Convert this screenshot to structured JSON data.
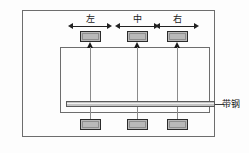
{
  "diagram": {
    "background_color": "#fdfdfd",
    "frame_border_color": "#6d6d6d",
    "block_fill_color": "#b9b9b9",
    "block_border_color": "#2b2b2b",
    "strip_fill_color": "#c4c4c4",
    "line_color": "#8b8b8b",
    "arrow_color": "#222222"
  },
  "columns": [
    {
      "label": "左",
      "meaning": "left"
    },
    {
      "label": "中",
      "meaning": "middle"
    },
    {
      "label": "右",
      "meaning": "right"
    }
  ],
  "annotations": {
    "strip_label": "带钢"
  }
}
